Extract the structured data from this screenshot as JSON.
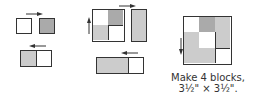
{
  "colors": {
    "outline": "#333333",
    "white": "#ffffff",
    "light_gray": "#cccccc",
    "medium_gray": "#aaaaaa",
    "arrow": "#333333"
  },
  "step1": {
    "pieces": [
      {
        "name": "white-square",
        "fill": "white"
      },
      {
        "name": "gray-square",
        "fill": "medium_gray"
      }
    ],
    "arrow_top": "pointing right",
    "pair": {
      "left": "light_gray",
      "right": "white"
    },
    "arrow_pair": "pointing left"
  },
  "step2": {
    "four_patch": [
      "white",
      "medium_gray",
      "light_gray",
      "white"
    ],
    "tall_rect": "light_gray",
    "arrow_left": "pointing up",
    "arrow_top": "pointing right",
    "wide_rect": {
      "left": "light_gray",
      "right": "white"
    },
    "arrow_wide": "pointing left"
  },
  "step3": {
    "block_description": "finished block with 4-patch, tall side rectangle, and wide bottom rectangle",
    "arrow_left": "pointing down"
  },
  "caption": {
    "line1": "Make 4 blocks,",
    "line2": "3½\" × 3½\"."
  }
}
